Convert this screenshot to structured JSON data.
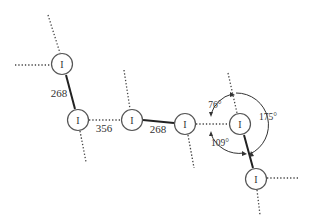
{
  "diagram": {
    "atoms": [
      {
        "id": "A",
        "label": "I"
      },
      {
        "id": "B",
        "label": "I"
      },
      {
        "id": "C",
        "label": "I"
      },
      {
        "id": "D",
        "label": "I"
      },
      {
        "id": "E",
        "label": "I"
      },
      {
        "id": "F",
        "label": "I"
      }
    ],
    "distances": {
      "a_b": "268",
      "b_c": "356",
      "c_d": "268"
    },
    "angles": {
      "upper": "76°",
      "lower": "109°",
      "right": "175°"
    }
  }
}
